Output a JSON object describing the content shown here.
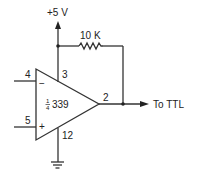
{
  "diagram": {
    "supply_label": "+5 V",
    "resistor_label": "10 K",
    "chip_fraction_num": "1",
    "chip_fraction_den": "4",
    "chip_label": "339",
    "pins": {
      "inverting": "4",
      "noninverting": "5",
      "supply": "3",
      "ground": "12",
      "output": "2"
    },
    "inverting_symbol": "−",
    "noninverting_symbol": "+",
    "output_label": "To TTL"
  }
}
